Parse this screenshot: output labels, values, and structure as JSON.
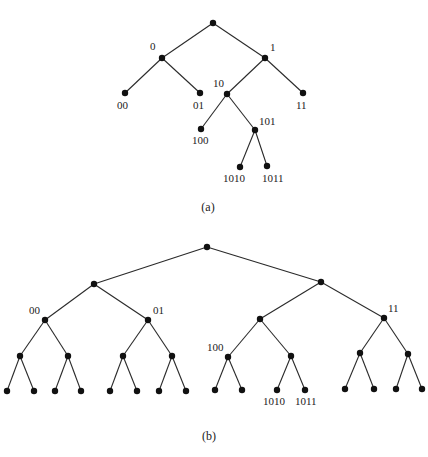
{
  "figures": [
    {
      "id": "a",
      "caption": "(a)",
      "caption_pos": [
        208,
        211
      ],
      "node_radius": 3.2,
      "nodes": [
        {
          "id": "root",
          "x": 213,
          "y": 23,
          "label": ""
        },
        {
          "id": "0",
          "x": 162,
          "y": 58,
          "label": "0",
          "lx": 150,
          "ly": 50
        },
        {
          "id": "1",
          "x": 265,
          "y": 58,
          "label": "1",
          "lx": 270,
          "ly": 51
        },
        {
          "id": "00",
          "x": 125,
          "y": 93,
          "label": "00",
          "lx": 117,
          "ly": 109
        },
        {
          "id": "01",
          "x": 200,
          "y": 93,
          "label": "01",
          "lx": 193,
          "ly": 109
        },
        {
          "id": "10",
          "x": 227,
          "y": 94,
          "label": "10",
          "lx": 213,
          "ly": 87
        },
        {
          "id": "11",
          "x": 303,
          "y": 93,
          "label": "11",
          "lx": 296,
          "ly": 109
        },
        {
          "id": "100",
          "x": 201,
          "y": 129,
          "label": "100",
          "lx": 192,
          "ly": 144
        },
        {
          "id": "101",
          "x": 255,
          "y": 130,
          "label": "101",
          "lx": 259,
          "ly": 125
        },
        {
          "id": "1010",
          "x": 240,
          "y": 167,
          "label": "1010",
          "lx": 223,
          "ly": 182
        },
        {
          "id": "1011",
          "x": 267,
          "y": 166,
          "label": "1011",
          "lx": 262,
          "ly": 182
        }
      ],
      "edges": [
        [
          "root",
          "0"
        ],
        [
          "root",
          "1"
        ],
        [
          "0",
          "00"
        ],
        [
          "0",
          "01"
        ],
        [
          "1",
          "10"
        ],
        [
          "1",
          "11"
        ],
        [
          "10",
          "100"
        ],
        [
          "10",
          "101"
        ],
        [
          "101",
          "1010"
        ],
        [
          "101",
          "1011"
        ]
      ]
    },
    {
      "id": "b",
      "caption": "(b)",
      "caption_pos": [
        209,
        440
      ],
      "node_radius": 3.2,
      "nodes": [
        {
          "id": "root",
          "x": 207,
          "y": 247,
          "label": ""
        },
        {
          "id": "0",
          "x": 94,
          "y": 284,
          "label": ""
        },
        {
          "id": "1",
          "x": 321,
          "y": 282,
          "label": ""
        },
        {
          "id": "00",
          "x": 45,
          "y": 320,
          "label": "00",
          "lx": 29,
          "ly": 314
        },
        {
          "id": "01",
          "x": 148,
          "y": 320,
          "label": "01",
          "lx": 153,
          "ly": 314
        },
        {
          "id": "10",
          "x": 260,
          "y": 319,
          "label": ""
        },
        {
          "id": "11",
          "x": 384,
          "y": 318,
          "label": "11",
          "lx": 388,
          "ly": 312
        },
        {
          "id": "000",
          "x": 20,
          "y": 356,
          "label": ""
        },
        {
          "id": "001",
          "x": 68,
          "y": 356,
          "label": ""
        },
        {
          "id": "010",
          "x": 123,
          "y": 356,
          "label": ""
        },
        {
          "id": "011",
          "x": 172,
          "y": 356,
          "label": ""
        },
        {
          "id": "100",
          "x": 228,
          "y": 357,
          "label": "100",
          "lx": 207,
          "ly": 351
        },
        {
          "id": "101",
          "x": 291,
          "y": 356,
          "label": ""
        },
        {
          "id": "110",
          "x": 360,
          "y": 353,
          "label": ""
        },
        {
          "id": "111",
          "x": 408,
          "y": 354,
          "label": ""
        },
        {
          "id": "0000",
          "x": 7,
          "y": 391,
          "label": ""
        },
        {
          "id": "0001",
          "x": 34,
          "y": 391,
          "label": ""
        },
        {
          "id": "0010",
          "x": 55,
          "y": 391,
          "label": ""
        },
        {
          "id": "0011",
          "x": 81,
          "y": 391,
          "label": ""
        },
        {
          "id": "0100",
          "x": 110,
          "y": 391,
          "label": ""
        },
        {
          "id": "0101",
          "x": 137,
          "y": 391,
          "label": ""
        },
        {
          "id": "0110",
          "x": 159,
          "y": 391,
          "label": ""
        },
        {
          "id": "0111",
          "x": 186,
          "y": 391,
          "label": ""
        },
        {
          "id": "1000",
          "x": 215,
          "y": 390,
          "label": ""
        },
        {
          "id": "1001",
          "x": 242,
          "y": 390,
          "label": ""
        },
        {
          "id": "1010",
          "x": 277,
          "y": 390,
          "label": "1010",
          "lx": 263,
          "ly": 405
        },
        {
          "id": "1011",
          "x": 305,
          "y": 390,
          "label": "1011",
          "lx": 295,
          "ly": 405
        },
        {
          "id": "1100",
          "x": 345,
          "y": 389,
          "label": ""
        },
        {
          "id": "1101",
          "x": 374,
          "y": 389,
          "label": ""
        },
        {
          "id": "1110",
          "x": 396,
          "y": 389,
          "label": ""
        },
        {
          "id": "1111",
          "x": 422,
          "y": 389,
          "label": ""
        }
      ],
      "edges": [
        [
          "root",
          "0"
        ],
        [
          "root",
          "1"
        ],
        [
          "0",
          "00"
        ],
        [
          "0",
          "01"
        ],
        [
          "1",
          "10"
        ],
        [
          "1",
          "11"
        ],
        [
          "00",
          "000"
        ],
        [
          "00",
          "001"
        ],
        [
          "01",
          "010"
        ],
        [
          "01",
          "011"
        ],
        [
          "10",
          "100"
        ],
        [
          "10",
          "101"
        ],
        [
          "11",
          "110"
        ],
        [
          "11",
          "111"
        ],
        [
          "000",
          "0000"
        ],
        [
          "000",
          "0001"
        ],
        [
          "001",
          "0010"
        ],
        [
          "001",
          "0011"
        ],
        [
          "010",
          "0100"
        ],
        [
          "010",
          "0101"
        ],
        [
          "011",
          "0110"
        ],
        [
          "011",
          "0111"
        ],
        [
          "100",
          "1000"
        ],
        [
          "100",
          "1001"
        ],
        [
          "101",
          "1010"
        ],
        [
          "101",
          "1011"
        ],
        [
          "110",
          "1100"
        ],
        [
          "110",
          "1101"
        ],
        [
          "111",
          "1110"
        ],
        [
          "111",
          "1111"
        ]
      ]
    }
  ]
}
